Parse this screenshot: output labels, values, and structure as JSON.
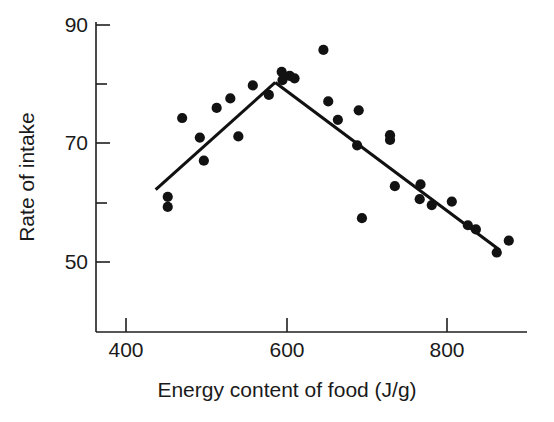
{
  "chart_data": {
    "type": "scatter",
    "title": "",
    "xlabel": "Energy content of food (J/g)",
    "ylabel": "Rate of intake",
    "xlim": [
      330,
      560
    ],
    "ylim": [
      44,
      91
    ],
    "grid": false,
    "legend": null,
    "x_ticks_major": [
      400,
      600,
      800
    ],
    "x_tick_labels": [
      "400",
      "600",
      "800"
    ],
    "y_ticks_major": [
      50,
      70,
      90
    ],
    "y_tick_labels": [
      "50",
      "70",
      "90"
    ],
    "y_ticks_minor": [
      60,
      80
    ],
    "marker": "filled-circle",
    "marker_color": "#121212",
    "points": [
      {
        "x": 452,
        "y": 61.0
      },
      {
        "x": 452,
        "y": 59.3
      },
      {
        "x": 470,
        "y": 74.3
      },
      {
        "x": 492,
        "y": 71.0
      },
      {
        "x": 497,
        "y": 67.1
      },
      {
        "x": 513,
        "y": 76.0
      },
      {
        "x": 530,
        "y": 77.6
      },
      {
        "x": 540,
        "y": 71.2
      },
      {
        "x": 558,
        "y": 79.8
      },
      {
        "x": 578,
        "y": 78.2
      },
      {
        "x": 594,
        "y": 82.1
      },
      {
        "x": 595,
        "y": 80.7
      },
      {
        "x": 604,
        "y": 81.4
      },
      {
        "x": 610,
        "y": 81.0
      },
      {
        "x": 646,
        "y": 85.8
      },
      {
        "x": 652,
        "y": 77.1
      },
      {
        "x": 664,
        "y": 74.0
      },
      {
        "x": 690,
        "y": 75.6
      },
      {
        "x": 688,
        "y": 69.7
      },
      {
        "x": 694,
        "y": 57.4
      },
      {
        "x": 729,
        "y": 71.4
      },
      {
        "x": 729,
        "y": 70.6
      },
      {
        "x": 735,
        "y": 62.8
      },
      {
        "x": 767,
        "y": 63.1
      },
      {
        "x": 766,
        "y": 60.6
      },
      {
        "x": 781,
        "y": 59.6
      },
      {
        "x": 806,
        "y": 60.2
      },
      {
        "x": 826,
        "y": 56.2
      },
      {
        "x": 836,
        "y": 55.5
      },
      {
        "x": 862,
        "y": 51.6
      },
      {
        "x": 877,
        "y": 53.6
      }
    ],
    "fit_lines": [
      {
        "name": "ascending-segment",
        "points": [
          {
            "x": 437,
            "y": 62.2
          },
          {
            "x": 586,
            "y": 80.3
          }
        ]
      },
      {
        "name": "descending-segment",
        "points": [
          {
            "x": 586,
            "y": 80.3
          },
          {
            "x": 866,
            "y": 52.0
          }
        ]
      }
    ]
  },
  "axes": {
    "x_title": "Energy content of food (J/g)",
    "y_title": "Rate of intake",
    "x_labels": [
      "400",
      "600",
      "800"
    ],
    "y_labels": [
      "90",
      "70",
      "50"
    ]
  }
}
